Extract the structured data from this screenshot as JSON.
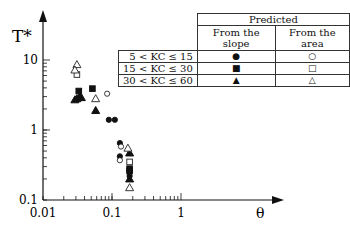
{
  "chart_data": {
    "type": "scatter",
    "title": "",
    "xlabel": "θ",
    "ylabel": "T*",
    "xscale": "log",
    "yscale": "log",
    "xlim": [
      0.01,
      3
    ],
    "ylim": [
      0.1,
      40
    ],
    "x_ticks": [
      "0.01",
      "0.1",
      "1"
    ],
    "y_ticks": [
      "0.1",
      "1",
      "10"
    ],
    "grid": false,
    "legend": {
      "position": "top-right",
      "header": "Predicted",
      "columns": [
        "From the slope",
        "From the area"
      ],
      "rows": [
        {
          "label": "5  <  KC ≤ 15",
          "slope_marker": "●",
          "area_marker": "○"
        },
        {
          "label": "15  <  KC ≤ 30",
          "slope_marker": "■",
          "area_marker": "□"
        },
        {
          "label": "30  <  KC ≤ 60",
          "slope_marker": "▲",
          "area_marker": "△"
        }
      ]
    },
    "series": [
      {
        "name": "5 < KC ≤ 15, from the slope",
        "marker": "filled-circle",
        "points": [
          [
            0.09,
            1.4
          ],
          [
            0.11,
            1.4
          ],
          [
            0.13,
            0.65
          ],
          [
            0.13,
            0.42
          ],
          [
            0.18,
            0.25
          ],
          [
            0.18,
            0.22
          ]
        ]
      },
      {
        "name": "5 < KC ≤ 15, from the area",
        "marker": "open-circle",
        "points": [
          [
            0.085,
            3.3
          ],
          [
            0.135,
            0.58
          ],
          [
            0.13,
            0.37
          ]
        ]
      },
      {
        "name": "15 < KC ≤ 30, from the slope",
        "marker": "filled-square",
        "points": [
          [
            0.033,
            3.6
          ],
          [
            0.052,
            3.9
          ],
          [
            0.18,
            0.28
          ],
          [
            0.18,
            0.26
          ]
        ]
      },
      {
        "name": "15 < KC ≤ 30, from the area",
        "marker": "open-square",
        "points": [
          [
            0.031,
            6.2
          ],
          [
            0.18,
            0.35
          ]
        ]
      },
      {
        "name": "30 < KC ≤ 60, from the slope",
        "marker": "filled-triangle",
        "points": [
          [
            0.029,
            2.7
          ],
          [
            0.031,
            2.8
          ],
          [
            0.034,
            3.0
          ],
          [
            0.036,
            2.9
          ],
          [
            0.058,
            1.9
          ],
          [
            0.18,
            0.47
          ],
          [
            0.18,
            0.2
          ]
        ]
      },
      {
        "name": "30 < KC ≤ 60, from the area",
        "marker": "open-triangle",
        "points": [
          [
            0.031,
            8.6
          ],
          [
            0.029,
            7.2
          ],
          [
            0.058,
            2.8
          ],
          [
            0.17,
            0.55
          ],
          [
            0.18,
            0.15
          ]
        ]
      }
    ]
  }
}
